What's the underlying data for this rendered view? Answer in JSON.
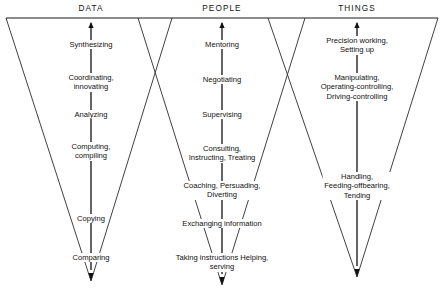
{
  "diagram": {
    "title_note": "Worker functions hierarchy chart",
    "columns": [
      {
        "id": "data",
        "header": "DATA",
        "header_x": 91,
        "header_y": 4,
        "axis_x": 91,
        "apex_x": 91,
        "apex_y": 281,
        "top_y": 18,
        "left_top_x": 6,
        "right_top_x": 172,
        "arrow_direction": "up",
        "functions": [
          {
            "text": "Synthesizing",
            "x": 91,
            "y": 40
          },
          {
            "text": "Coordinating,\ninnovating",
            "x": 91,
            "y": 73
          },
          {
            "text": "Analyzing",
            "x": 91,
            "y": 110
          },
          {
            "text": "Computing,\ncompiling",
            "x": 91,
            "y": 142
          },
          {
            "text": "Copying",
            "x": 91,
            "y": 214
          },
          {
            "text": "Comparing",
            "x": 91,
            "y": 253
          }
        ]
      },
      {
        "id": "people",
        "header": "PEOPLE",
        "header_x": 222,
        "header_y": 4,
        "axis_x": 222,
        "apex_x": 222,
        "apex_y": 285,
        "top_y": 18,
        "left_top_x": 138,
        "right_top_x": 305,
        "arrow_direction": "up",
        "functions": [
          {
            "text": "Mentoring",
            "x": 222,
            "y": 40
          },
          {
            "text": "Negotiating",
            "x": 222,
            "y": 75
          },
          {
            "text": "Supervising",
            "x": 222,
            "y": 110
          },
          {
            "text": "Consulting,\nInstructing, Treating",
            "x": 222,
            "y": 144
          },
          {
            "text": "Coaching, Persuading,\nDiverting",
            "x": 222,
            "y": 181
          },
          {
            "text": "Exchanging information",
            "x": 222,
            "y": 219
          },
          {
            "text": "Taking instructions Helping,\nserving",
            "x": 222,
            "y": 253
          }
        ]
      },
      {
        "id": "things",
        "header": "THINGS",
        "header_x": 357,
        "header_y": 4,
        "axis_x": 357,
        "apex_x": 357,
        "apex_y": 277,
        "top_y": 18,
        "left_top_x": 268,
        "right_top_x": 438,
        "arrow_direction": "up",
        "functions": [
          {
            "text": "Precision working,\nSetting up",
            "x": 357,
            "y": 36
          },
          {
            "text": "Manipulating,\nOperating-controlling,\nDriving-controlling",
            "x": 357,
            "y": 73
          },
          {
            "text": "Handling,\nFeeding-offbearing,\nTending",
            "x": 357,
            "y": 172
          }
        ]
      }
    ],
    "frame": {
      "top_rule_y": 18,
      "top_rule_x1": 6,
      "top_rule_x2": 438
    },
    "colors": {
      "ink": "#111111",
      "line": "#2b2b2b",
      "background": "#ffffff"
    }
  }
}
